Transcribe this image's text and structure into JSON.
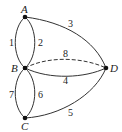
{
  "graph": {
    "nodes": [
      {
        "id": "A",
        "label": "A",
        "x": 25,
        "y": 17
      },
      {
        "id": "B",
        "label": "B",
        "x": 25,
        "y": 68
      },
      {
        "id": "C",
        "label": "C",
        "x": 25,
        "y": 118
      },
      {
        "id": "D",
        "label": "D",
        "x": 106,
        "y": 68
      }
    ],
    "edges": [
      {
        "label": "1",
        "from": "A",
        "to": "B",
        "style": "solid"
      },
      {
        "label": "2",
        "from": "A",
        "to": "B",
        "style": "solid"
      },
      {
        "label": "3",
        "from": "A",
        "to": "D",
        "style": "solid"
      },
      {
        "label": "4",
        "from": "B",
        "to": "D",
        "style": "solid"
      },
      {
        "label": "5",
        "from": "C",
        "to": "D",
        "style": "solid"
      },
      {
        "label": "6",
        "from": "B",
        "to": "C",
        "style": "solid"
      },
      {
        "label": "7",
        "from": "B",
        "to": "C",
        "style": "solid"
      },
      {
        "label": "8",
        "from": "B",
        "to": "D",
        "style": "dashed"
      }
    ]
  }
}
